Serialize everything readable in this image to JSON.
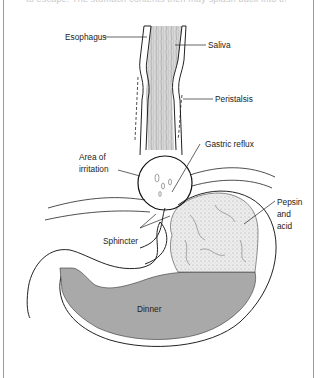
{
  "figure": {
    "top_caption_partial": "to escape. The stomach contents then may splash back into the esophagus.",
    "labels": {
      "esophagus": "Esophagus",
      "saliva": "Saliva",
      "peristalsis": "Peristalsis",
      "gastric_reflux": "Gastric reflux",
      "area_of_irritation_line1": "Area of",
      "area_of_irritation_line2": "irritation",
      "sphincter": "Sphincter",
      "pepsin_line1": "Pepsin",
      "pepsin_line2": "and",
      "pepsin_line3": "acid",
      "dinner": "Dinner"
    },
    "colors": {
      "line": "#222222",
      "dinner_fill": "#a9a9a9",
      "acid_fill": "#ececec",
      "frame": "#9a9a9a"
    }
  }
}
